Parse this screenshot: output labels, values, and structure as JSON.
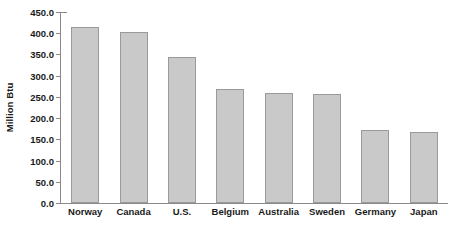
{
  "chart_data": {
    "type": "bar",
    "title": "",
    "subtitle": "",
    "xlabel": "",
    "ylabel": "Million Btu",
    "ylim": [
      0,
      450
    ],
    "y_ticks": [
      "0.0",
      "50.0",
      "100.0",
      "150.0",
      "200.0",
      "250.0",
      "300.0",
      "350.0",
      "400.0",
      "450.0"
    ],
    "y_tick_values": [
      0,
      50,
      100,
      150,
      200,
      250,
      300,
      350,
      400,
      450
    ],
    "grid": false,
    "legend": false,
    "legend_position": "none",
    "categories": [
      "Norway",
      "Canada",
      "U.S.",
      "Belgium",
      "Australia",
      "Sweden",
      "Germany",
      "Japan"
    ],
    "values": [
      415,
      402,
      343,
      269,
      259,
      257,
      172,
      167
    ],
    "bars": [
      {
        "label": "Norway",
        "value": 415
      },
      {
        "label": "Canada",
        "value": 402
      },
      {
        "label": "U.S.",
        "value": 343
      },
      {
        "label": "Belgium",
        "value": 269
      },
      {
        "label": "Australia",
        "value": 259
      },
      {
        "label": "Sweden",
        "value": 257
      },
      {
        "label": "Germany",
        "value": 172
      },
      {
        "label": "Japan",
        "value": 167
      }
    ],
    "colors": {
      "bar_fill": "#c9c9c9",
      "bar_border": "#9a9a9a",
      "axis": "#8a8a8a",
      "text": "#1a1a1a",
      "background": "#ffffff"
    }
  }
}
